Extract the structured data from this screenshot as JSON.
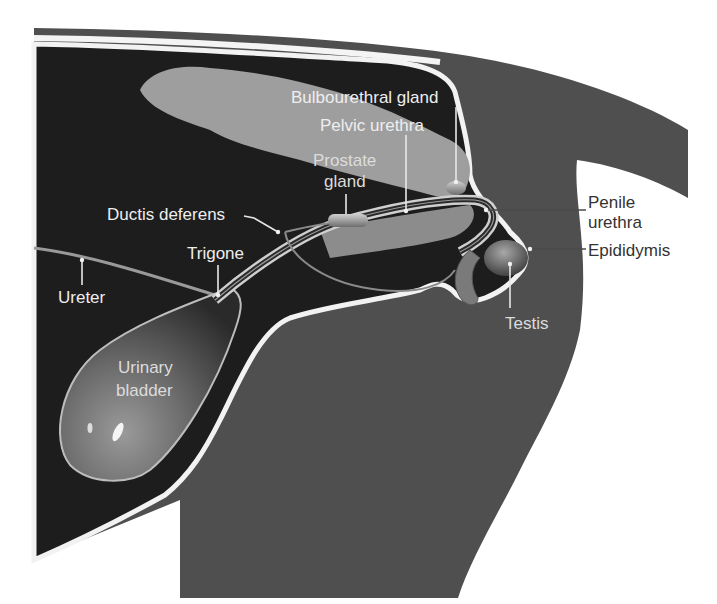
{
  "diagram": {
    "colors": {
      "background": "#ffffff",
      "body_dark": "#1c1c1c",
      "body_mid": "#4d4d4d",
      "skin_band": "#5a5a5a",
      "outline": "#f2f2f2",
      "pelvic_bone": "#9e9e9e",
      "organ_light": "#8a8a8a"
    },
    "labels": {
      "bulbourethral_gland": "Bulbourethral gland",
      "pelvic_urethra": "Pelvic urethra",
      "prostate_line1": "Prostate",
      "prostate_line2": "gland",
      "ductus_deferens": "Ductis deferens",
      "trigone": "Trigone",
      "ureter": "Ureter",
      "urinary_line1": "Urinary",
      "urinary_line2": "bladder",
      "penile_line1": "Penile",
      "penile_line2": "urethra",
      "epididymis": "Epididymis",
      "testis": "Testis"
    }
  }
}
